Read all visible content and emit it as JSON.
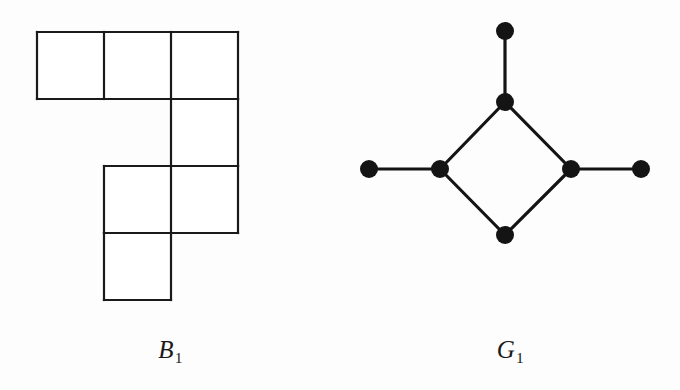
{
  "figure": {
    "background_color": "#fdfdfd",
    "ink_color": "#1a1a1a",
    "width": 680,
    "height": 390
  },
  "panels": [
    {
      "id": "polyomino",
      "caption_letter": "B",
      "caption_subscript": "1",
      "caption_text": "B1"
    },
    {
      "id": "graph",
      "caption_letter": "G",
      "caption_subscript": "1",
      "caption_text": "G1"
    }
  ],
  "polyomino": {
    "name": "B1",
    "cell_size": 67,
    "origin_x": 37,
    "origin_y": 32,
    "stroke_width": 2.2,
    "stroke_color": "#1a1a1a",
    "fill_color": "#ffffff",
    "rows": 4,
    "columns": 3,
    "cell_count": 7,
    "cells": [
      {
        "row": 0,
        "col": 0
      },
      {
        "row": 0,
        "col": 1
      },
      {
        "row": 0,
        "col": 2
      },
      {
        "row": 1,
        "col": 2
      },
      {
        "row": 2,
        "col": 1
      },
      {
        "row": 2,
        "col": 2
      },
      {
        "row": 3,
        "col": 1
      }
    ]
  },
  "graph": {
    "name": "G1",
    "node_radius": 9,
    "node_color": "#141414",
    "edge_color": "#141414",
    "edge_width": 3.2,
    "node_count": 7,
    "edge_count": 7,
    "nodes": [
      {
        "id": "top-pendant",
        "x": 505,
        "y": 31,
        "degree": 1
      },
      {
        "id": "diamond-top",
        "x": 505,
        "y": 102,
        "degree": 3
      },
      {
        "id": "left-pendant",
        "x": 369,
        "y": 169,
        "degree": 1
      },
      {
        "id": "diamond-left",
        "x": 440,
        "y": 169,
        "degree": 3
      },
      {
        "id": "diamond-right",
        "x": 571,
        "y": 169,
        "degree": 3
      },
      {
        "id": "right-pendant",
        "x": 641,
        "y": 169,
        "degree": 1
      },
      {
        "id": "diamond-bottom",
        "x": 505,
        "y": 235,
        "degree": 2
      }
    ],
    "edges": [
      {
        "from": "top-pendant",
        "to": "diamond-top"
      },
      {
        "from": "diamond-top",
        "to": "diamond-left"
      },
      {
        "from": "diamond-top",
        "to": "diamond-right"
      },
      {
        "from": "left-pendant",
        "to": "diamond-left"
      },
      {
        "from": "diamond-right",
        "to": "right-pendant"
      },
      {
        "from": "diamond-left",
        "to": "diamond-bottom"
      },
      {
        "from": "diamond-right",
        "to": "diamond-bottom"
      }
    ]
  }
}
